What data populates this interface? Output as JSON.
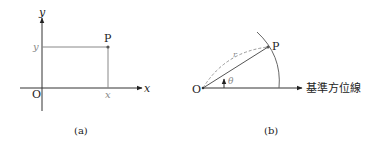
{
  "diagram_a": {
    "caption": "(a)",
    "origin_label": "O",
    "x_axis_label": "x",
    "y_axis_label": "y",
    "point_label": "P",
    "x_tick_label": "x",
    "y_tick_label": "y"
  },
  "diagram_b": {
    "caption": "(b)",
    "origin_label": "O",
    "point_label": "P",
    "radius_label": "r",
    "angle_label": "θ",
    "reference_line_label": "基準方位線"
  },
  "colors": {
    "axis": "#333333",
    "guide": "#888888",
    "dashed": "#999999",
    "arc": "#666666"
  }
}
